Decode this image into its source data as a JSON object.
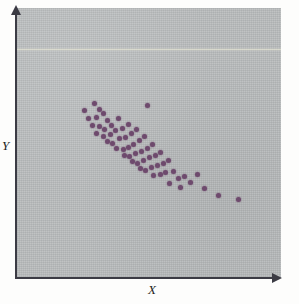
{
  "figure": {
    "kind": "scatterplot-figure",
    "panel_color": "#b9bcbd",
    "point_color": "#6e4a6d",
    "axis_color": "#3b3b44"
  },
  "axes": {
    "x_label": "X",
    "y_label": "Y",
    "x_arrow_icon": "arrow-right-icon",
    "y_arrow_icon": "arrow-up-icon"
  },
  "chart_data": {
    "type": "scatter",
    "title": "",
    "xlabel": "X",
    "ylabel": "Y",
    "grid": false,
    "legend": null,
    "xlim": [
      0,
      100
    ],
    "ylim": [
      0,
      100
    ],
    "axis_ticks": {
      "x": [],
      "y": []
    },
    "annotations": [],
    "n_points": 62,
    "series": [
      {
        "name": "observations",
        "color": "#6e4a6d",
        "marker": "circle",
        "points": [
          [
            26.0,
            62.0
          ],
          [
            29.5,
            64.5
          ],
          [
            31.5,
            62.5
          ],
          [
            27.5,
            59.0
          ],
          [
            30.5,
            59.5
          ],
          [
            33.0,
            61.0
          ],
          [
            34.5,
            58.5
          ],
          [
            29.0,
            56.5
          ],
          [
            31.5,
            56.0
          ],
          [
            33.5,
            55.0
          ],
          [
            36.0,
            56.5
          ],
          [
            38.5,
            59.0
          ],
          [
            30.5,
            53.5
          ],
          [
            33.0,
            52.5
          ],
          [
            35.5,
            53.0
          ],
          [
            37.5,
            54.5
          ],
          [
            40.0,
            55.5
          ],
          [
            42.5,
            57.0
          ],
          [
            34.5,
            50.5
          ],
          [
            36.5,
            50.0
          ],
          [
            39.0,
            51.5
          ],
          [
            41.5,
            52.0
          ],
          [
            43.5,
            53.5
          ],
          [
            45.5,
            55.0
          ],
          [
            38.0,
            48.0
          ],
          [
            40.5,
            47.5
          ],
          [
            42.5,
            48.5
          ],
          [
            44.5,
            49.5
          ],
          [
            46.5,
            51.0
          ],
          [
            48.5,
            52.5
          ],
          [
            41.0,
            45.5
          ],
          [
            43.0,
            45.0
          ],
          [
            45.0,
            46.0
          ],
          [
            47.5,
            47.0
          ],
          [
            49.5,
            48.0
          ],
          [
            51.5,
            49.5
          ],
          [
            44.0,
            43.0
          ],
          [
            46.0,
            42.5
          ],
          [
            48.0,
            43.5
          ],
          [
            50.5,
            44.5
          ],
          [
            52.5,
            45.5
          ],
          [
            54.5,
            46.5
          ],
          [
            47.0,
            40.5
          ],
          [
            49.0,
            40.0
          ],
          [
            51.0,
            41.0
          ],
          [
            53.5,
            41.5
          ],
          [
            55.5,
            42.5
          ],
          [
            57.5,
            43.5
          ],
          [
            52.0,
            38.0
          ],
          [
            54.5,
            38.5
          ],
          [
            56.5,
            39.0
          ],
          [
            59.5,
            39.5
          ],
          [
            61.5,
            37.0
          ],
          [
            63.5,
            37.5
          ],
          [
            58.0,
            35.0
          ],
          [
            66.0,
            35.5
          ],
          [
            68.5,
            38.5
          ],
          [
            71.0,
            33.0
          ],
          [
            76.5,
            30.5
          ],
          [
            84.0,
            29.0
          ],
          [
            49.5,
            64.0
          ],
          [
            62.0,
            33.5
          ]
        ]
      }
    ]
  }
}
